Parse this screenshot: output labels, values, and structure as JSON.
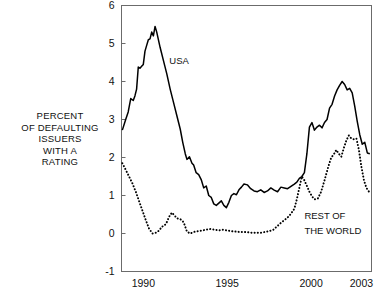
{
  "chart_data": {
    "type": "line",
    "title": "",
    "subtitle": "",
    "xlabel": "",
    "ylabel": "PERCENT OF DEFAULTING ISSUERS WITH A RATING",
    "ylabel_lines": [
      "PERCENT",
      "OF DEFAULTING",
      "ISSUERS",
      "WITH A",
      "RATING"
    ],
    "xlim": [
      1988.7,
      2003.6
    ],
    "ylim": [
      -1,
      6
    ],
    "grid": false,
    "legend_position": "inline-annotations",
    "xticks": [
      1990,
      1995,
      2000,
      2003
    ],
    "xticklabels": [
      "1990",
      "1995",
      "2000",
      "2003"
    ],
    "yticks": [
      -1,
      0,
      1,
      2,
      3,
      4,
      5,
      6
    ],
    "yticklabels": [
      "-1",
      "0",
      "1",
      "2",
      "3",
      "4",
      "5",
      "6"
    ],
    "annotations": [
      {
        "text": "USA",
        "x": 1991.55,
        "y": 4.45
      },
      {
        "text": "REST OF",
        "x": 1999.6,
        "y": 0.38
      },
      {
        "text": "THE WORLD",
        "x": 1999.6,
        "y": -0.02
      }
    ],
    "series": [
      {
        "name": "USA",
        "style": "solid",
        "color": "#000000",
        "x": [
          1988.75,
          1988.95,
          1989.1,
          1989.25,
          1989.4,
          1989.5,
          1989.6,
          1989.7,
          1989.8,
          1989.9,
          1990.0,
          1990.1,
          1990.2,
          1990.3,
          1990.4,
          1990.5,
          1990.6,
          1990.7,
          1990.8,
          1991.0,
          1991.2,
          1991.4,
          1991.6,
          1991.8,
          1992.0,
          1992.2,
          1992.35,
          1992.5,
          1992.6,
          1992.75,
          1992.9,
          1993.0,
          1993.15,
          1993.3,
          1993.45,
          1993.6,
          1993.75,
          1993.9,
          1994.05,
          1994.2,
          1994.35,
          1994.5,
          1994.65,
          1994.8,
          1994.95,
          1995.1,
          1995.25,
          1995.4,
          1995.55,
          1995.7,
          1995.85,
          1996.0,
          1996.2,
          1996.4,
          1996.6,
          1996.8,
          1997.0,
          1997.2,
          1997.4,
          1997.6,
          1997.8,
          1998.0,
          1998.2,
          1998.4,
          1998.6,
          1998.8,
          1999.0,
          1999.15,
          1999.3,
          1999.45,
          1999.6,
          1999.75,
          1999.9,
          2000.05,
          2000.2,
          2000.35,
          2000.5,
          2000.65,
          2000.8,
          2000.95,
          2001.1,
          2001.25,
          2001.4,
          2001.55,
          2001.7,
          2001.85,
          2002.0,
          2002.15,
          2002.3,
          2002.45,
          2002.6,
          2002.75,
          2002.9,
          2003.05,
          2003.2,
          2003.35,
          2003.5
        ],
        "y": [
          2.72,
          3.0,
          3.2,
          3.55,
          3.5,
          3.62,
          3.8,
          4.38,
          4.35,
          4.4,
          4.45,
          4.8,
          4.95,
          5.1,
          5.12,
          5.3,
          5.2,
          5.45,
          5.3,
          4.9,
          4.55,
          4.2,
          3.8,
          3.45,
          3.1,
          2.75,
          2.4,
          2.1,
          1.95,
          2.02,
          1.85,
          1.8,
          1.6,
          1.55,
          1.42,
          1.2,
          1.25,
          1.0,
          0.95,
          0.78,
          0.74,
          0.8,
          0.86,
          0.74,
          0.68,
          0.82,
          1.0,
          1.05,
          1.02,
          1.15,
          1.22,
          1.3,
          1.28,
          1.18,
          1.12,
          1.1,
          1.15,
          1.08,
          1.12,
          1.2,
          1.14,
          1.1,
          1.22,
          1.2,
          1.18,
          1.24,
          1.3,
          1.35,
          1.45,
          1.5,
          1.6,
          2.1,
          2.8,
          2.92,
          2.72,
          2.8,
          2.85,
          2.78,
          2.92,
          3.0,
          3.3,
          3.4,
          3.62,
          3.78,
          3.9,
          4.0,
          3.92,
          3.78,
          3.82,
          3.7,
          3.35,
          2.95,
          2.6,
          2.35,
          2.4,
          2.12,
          2.1
        ]
      },
      {
        "name": "REST OF THE WORLD",
        "style": "dotted",
        "color": "#000000",
        "x": [
          1988.75,
          1988.95,
          1989.15,
          1989.35,
          1989.55,
          1989.75,
          1989.95,
          1990.15,
          1990.35,
          1990.55,
          1990.75,
          1990.95,
          1991.1,
          1991.25,
          1991.4,
          1991.55,
          1991.7,
          1991.85,
          1992.0,
          1992.2,
          1992.4,
          1992.6,
          1992.8,
          1993.0,
          1993.25,
          1993.5,
          1993.75,
          1994.0,
          1994.25,
          1994.5,
          1994.75,
          1995.0,
          1995.25,
          1995.5,
          1995.75,
          1996.0,
          1996.25,
          1996.5,
          1996.75,
          1997.0,
          1997.25,
          1997.5,
          1997.75,
          1998.0,
          1998.2,
          1998.4,
          1998.6,
          1998.8,
          1999.0,
          1999.15,
          1999.3,
          1999.45,
          1999.6,
          1999.75,
          1999.9,
          2000.05,
          2000.2,
          2000.4,
          2000.6,
          2000.8,
          2001.0,
          2001.2,
          2001.35,
          2001.5,
          2001.65,
          2001.8,
          2001.95,
          2002.1,
          2002.25,
          2002.4,
          2002.55,
          2002.7,
          2002.85,
          2003.0,
          2003.15,
          2003.3,
          2003.45,
          2003.5
        ],
        "y": [
          1.85,
          1.68,
          1.5,
          1.32,
          1.1,
          0.85,
          0.6,
          0.35,
          0.12,
          0.0,
          0.02,
          0.08,
          0.18,
          0.2,
          0.3,
          0.45,
          0.55,
          0.48,
          0.4,
          0.38,
          0.3,
          0.05,
          0.0,
          0.04,
          0.06,
          0.08,
          0.1,
          0.12,
          0.1,
          0.08,
          0.1,
          0.08,
          0.06,
          0.05,
          0.04,
          0.04,
          0.03,
          0.02,
          0.02,
          0.02,
          0.04,
          0.06,
          0.1,
          0.2,
          0.28,
          0.35,
          0.42,
          0.52,
          0.65,
          0.9,
          1.2,
          1.5,
          1.4,
          1.25,
          1.1,
          0.98,
          0.9,
          0.92,
          1.1,
          1.4,
          1.72,
          2.0,
          2.08,
          2.2,
          2.1,
          2.02,
          2.25,
          2.45,
          2.58,
          2.5,
          2.48,
          2.5,
          2.2,
          1.75,
          1.4,
          1.2,
          1.1,
          1.05
        ]
      }
    ]
  }
}
